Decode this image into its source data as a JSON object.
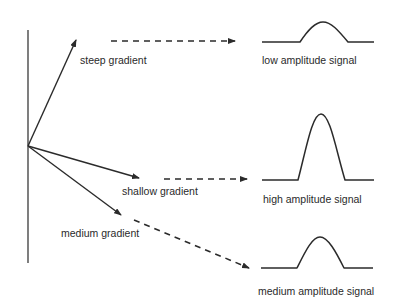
{
  "diagram": {
    "gradients": [
      {
        "id": "steep",
        "label": "steep gradient"
      },
      {
        "id": "shallow",
        "label": "shallow gradient"
      },
      {
        "id": "medium",
        "label": "medium gradient"
      }
    ],
    "signals": [
      {
        "id": "low",
        "label": "low amplitude signal"
      },
      {
        "id": "high",
        "label": "high amplitude signal"
      },
      {
        "id": "medium",
        "label": "medium amplitude signal"
      }
    ],
    "colors": {
      "line": "#2b2b2b",
      "text": "#2a2a2a",
      "background": "#ffffff"
    }
  }
}
